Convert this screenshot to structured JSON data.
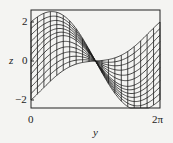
{
  "chart_data": {
    "type": "line",
    "title": "",
    "xlabel": "y",
    "ylabel": "z",
    "xlim": [
      0,
      6.2832
    ],
    "ylim": [
      -2.5,
      2.5
    ],
    "x_ticks": [
      {
        "value": 0,
        "label": "0"
      },
      {
        "value": 6.2832,
        "label": "2π"
      }
    ],
    "y_ticks": [
      {
        "value": 2,
        "label": "2"
      },
      {
        "value": 0,
        "label": "0"
      },
      {
        "value": -2,
        "label": "-2"
      }
    ],
    "grid": false,
    "legend": null,
    "series": [
      {
        "name": "curve-family",
        "count": 13,
        "z_at_y0_range": [
          -2,
          2
        ],
        "z_at_2pi_range": [
          -2,
          2
        ],
        "pinch_point": {
          "y": 3.1416,
          "z": 0
        }
      },
      {
        "name": "cross-lines",
        "count": 20,
        "note": "vertical-ish mesh lines connecting curves"
      }
    ],
    "colors": {
      "line": "#1a1a1a",
      "background": "#f4f4f2",
      "frame": "#222222"
    }
  },
  "labels": {
    "x_axis": "y",
    "y_axis": "z",
    "x_tick_0": "0",
    "x_tick_end": "2π",
    "y_tick_top": "2",
    "y_tick_mid": "0",
    "y_tick_bottom": "−2"
  },
  "layout": {
    "frame": {
      "left": 31,
      "top": 10,
      "right": 160,
      "bottom": 108
    },
    "z_zero_px": 61,
    "px_per_unit_z": 19.5
  }
}
